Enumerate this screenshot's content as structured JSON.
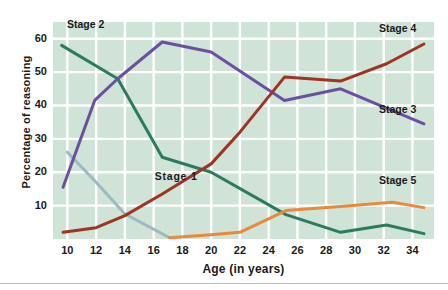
{
  "chart_data": {
    "type": "line",
    "title": "",
    "xlabel": "Age (in years)",
    "ylabel": "Percentage of reasoning",
    "xlim": [
      9,
      35.5
    ],
    "ylim": [
      0,
      65
    ],
    "xticks": [
      10,
      12,
      14,
      16,
      18,
      20,
      22,
      24,
      26,
      28,
      30,
      32,
      34
    ],
    "yticks": [
      10,
      20,
      30,
      40,
      50,
      60
    ],
    "grid": true,
    "legend_position": "inline-annotations",
    "plot_background": "#cfe3d6",
    "gridline_color": "#ffffff",
    "series": [
      {
        "name": "Stage 1",
        "color": "#9db9c4",
        "label_x": 17.6,
        "label_y": 18.5,
        "points": [
          [
            10,
            26
          ],
          [
            12,
            17
          ],
          [
            14,
            7.5
          ],
          [
            17.1,
            0.4
          ]
        ]
      },
      {
        "name": "Stage 2",
        "color": "#2d7a5f",
        "label_x": 11.5,
        "label_y": 64,
        "points": [
          [
            9.6,
            58
          ],
          [
            13.5,
            48
          ],
          [
            16.6,
            24.5
          ],
          [
            20,
            20
          ],
          [
            24.1,
            10
          ],
          [
            25.2,
            7.3
          ],
          [
            29,
            2
          ],
          [
            32.2,
            4.2
          ],
          [
            34.8,
            1.6
          ]
        ]
      },
      {
        "name": "Stage 3",
        "color": "#6b4fa0",
        "label_x": 33.2,
        "label_y": 38.5,
        "points": [
          [
            9.7,
            15.5
          ],
          [
            11.9,
            41.5
          ],
          [
            13.5,
            48
          ],
          [
            16.6,
            59
          ],
          [
            20,
            56
          ],
          [
            25.1,
            41.5
          ],
          [
            29,
            45
          ],
          [
            34.8,
            34.5
          ]
        ]
      },
      {
        "name": "Stage 4",
        "color": "#9e3326",
        "label_x": 33.2,
        "label_y": 63,
        "points": [
          [
            9.7,
            2
          ],
          [
            12,
            3.4
          ],
          [
            14,
            7
          ],
          [
            16.6,
            13.5
          ],
          [
            20,
            22.5
          ],
          [
            22,
            32
          ],
          [
            25.1,
            48.5
          ],
          [
            29,
            47.3
          ],
          [
            32.2,
            52.5
          ],
          [
            34.8,
            58.4
          ]
        ]
      },
      {
        "name": "Stage 5",
        "color": "#e8893c",
        "label_x": 33.2,
        "label_y": 17.5,
        "points": [
          [
            17.1,
            0.4
          ],
          [
            20,
            1.3
          ],
          [
            22,
            2
          ],
          [
            25.2,
            8.5
          ],
          [
            29,
            9.7
          ],
          [
            32.6,
            11
          ],
          [
            34.8,
            9.4
          ]
        ]
      }
    ]
  },
  "axes": {
    "y_title": "Percentage of reasoning",
    "x_title": "Age (in years)",
    "y_tick_labels": [
      "60",
      "50",
      "40",
      "30",
      "20",
      "10"
    ],
    "x_tick_labels": [
      "10",
      "12",
      "14",
      "16",
      "18",
      "20",
      "22",
      "24",
      "26",
      "28",
      "30",
      "32",
      "34"
    ]
  },
  "annotations": {
    "stage_1": "Stage 1",
    "stage_2": "Stage 2",
    "stage_3": "Stage 3",
    "stage_4": "Stage 4",
    "stage_5": "Stage 5"
  }
}
